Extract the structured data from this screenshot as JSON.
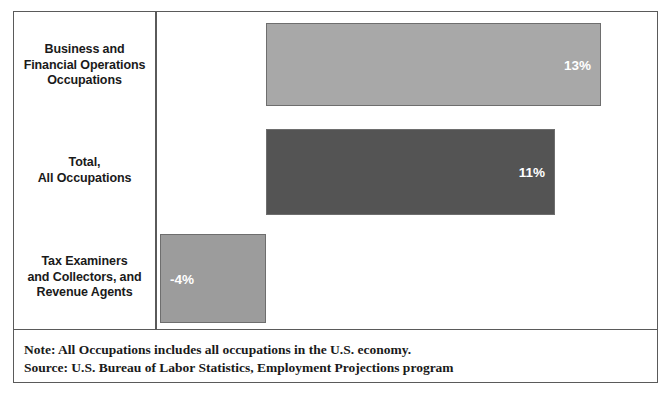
{
  "chart_data": {
    "type": "bar",
    "orientation": "horizontal",
    "title": "",
    "subtitle": "",
    "xlabel": "",
    "ylabel": "",
    "categories": [
      "Business and\nFinancial Operations\nOccupations",
      "Total,\nAll Occupations",
      "Tax Examiners\nand Collectors, and\nRevenue Agents"
    ],
    "values": [
      13,
      11,
      -4
    ],
    "value_labels": [
      "13%",
      "11%",
      "-4%"
    ],
    "xlim": [
      -4,
      13
    ],
    "grid": false,
    "legend": "none",
    "zero_baseline": true,
    "series": [
      {
        "name": "Percent change in employment, projected",
        "values": [
          13,
          11,
          -4
        ]
      }
    ],
    "annotations": [
      "Note: All Occupations includes all occupations in the U.S. economy.",
      "Source: U.S. Bureau of Labor Statistics, Employment Projections program"
    ]
  },
  "bars": [
    {
      "category_line1": "Business and",
      "category_line2": "Financial Operations",
      "category_line3": "Occupations",
      "value_label": "13%",
      "color": "#a8a8a8"
    },
    {
      "category_line1": "Total,",
      "category_line2": "All Occupations",
      "category_line3": "",
      "value_label": "11%",
      "color": "#545454"
    },
    {
      "category_line1": "Tax Examiners",
      "category_line2": "and Collectors, and",
      "category_line3": "Revenue Agents",
      "value_label": "-4%",
      "color": "#9c9c9c"
    }
  ],
  "footnote": {
    "note": "Note: All Occupations includes all occupations in the U.S. economy.",
    "source": "Source: U.S. Bureau of Labor Statistics, Employment Projections program"
  },
  "colors": {
    "bar_light": "#a8a8a8",
    "bar_dark": "#545454",
    "bar_negative": "#9c9c9c",
    "border": "#5a5a5a",
    "text": "#1a1a1a",
    "value_text": "#ffffff"
  }
}
